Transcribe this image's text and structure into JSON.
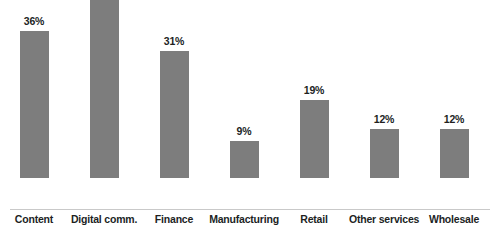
{
  "chart_data": {
    "type": "bar",
    "title": "",
    "subtitle": "",
    "xlabel": "",
    "ylabel": "",
    "categories": [
      "Content",
      "Digital comm.",
      "Finance",
      "Manufacturing",
      "Retail",
      "Other services",
      "Wholesale"
    ],
    "values": [
      36,
      44,
      31,
      9,
      19,
      12,
      12
    ],
    "data_labels": [
      "36%",
      "44%",
      "31%",
      "9%",
      "19%",
      "12%",
      "12%"
    ],
    "value_suffix": "%",
    "ylim": [
      0,
      44
    ],
    "grid": false,
    "legend": false,
    "legend_position": "none",
    "axis_visible": {
      "x_axis_line": true,
      "y_axis_line": false,
      "y_tick_labels": false,
      "x_tick_labels": true
    },
    "colors": {
      "bar": "#7d7d7d",
      "label_text": "#211f1f",
      "axis_line": "#c9c9c9",
      "background": "#ffffff"
    }
  }
}
